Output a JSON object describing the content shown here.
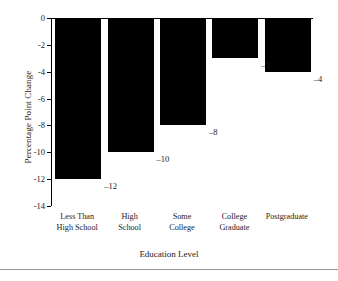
{
  "chart_data": {
    "type": "bar",
    "title": "",
    "xlabel": "Education Level",
    "ylabel": "Percentage Point Change",
    "categories": [
      "Less Than High School",
      "High School",
      "Some College",
      "College Graduate",
      "Postgraduate"
    ],
    "category_lines": [
      [
        "Less Than",
        "High School"
      ],
      [
        "High",
        "School"
      ],
      [
        "Some",
        "College"
      ],
      [
        "College",
        "Graduate"
      ],
      [
        "Postgraduate"
      ]
    ],
    "values": [
      -12,
      -10,
      -8,
      -3,
      -4
    ],
    "data_labels": [
      "–12",
      "–10",
      "–8",
      "–3",
      "–4"
    ],
    "ylim": [
      -14,
      0
    ],
    "yticks": [
      0,
      -2,
      -4,
      -6,
      -8,
      -10,
      -12,
      -14
    ],
    "ytick_labels": [
      "0",
      "-2",
      "-4",
      "-6",
      "-8",
      "-10",
      "-12",
      "-14"
    ],
    "grid": false,
    "legend": false,
    "bar_color": "#000000",
    "axis_color": "#000000",
    "background": "#ffffff"
  }
}
